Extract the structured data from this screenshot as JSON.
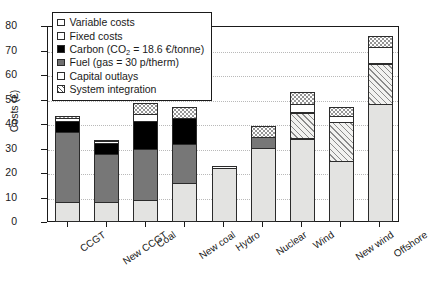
{
  "chart_data": {
    "type": "bar",
    "stacked": true,
    "title": "",
    "xlabel": "",
    "ylabel": "Costs (£)",
    "ylim": [
      0,
      80
    ],
    "yticks": [
      0,
      10,
      20,
      30,
      40,
      50,
      60,
      70,
      80
    ],
    "grid": true,
    "legend_position": "top-left",
    "categories": [
      "CCGT",
      "New CCGT",
      "Coal",
      "New coal",
      "Hydro",
      "Nuclear",
      "Wind",
      "New wind",
      "Offshore"
    ],
    "series": [
      {
        "name": "Capital outlays",
        "key": "capital",
        "color": "#e3e3e1",
        "values": [
          8,
          8,
          9,
          16,
          22,
          30,
          34,
          25,
          48
        ]
      },
      {
        "name": "Fuel (gas = 30 p/therm)",
        "key": "fuel",
        "color": "#777777",
        "values": [
          29,
          20,
          21,
          16,
          0,
          5,
          0,
          0,
          0
        ]
      },
      {
        "name": "Carbon (CO2 = 18.6 €/tonne)",
        "key": "carbon",
        "color": "#000000",
        "values": [
          5,
          5,
          12,
          11,
          0,
          0,
          0,
          0,
          0
        ]
      },
      {
        "name": "System integration",
        "key": "sysint",
        "color": "#f2f2f0",
        "values": [
          0,
          0,
          0,
          0,
          0,
          0,
          11,
          16,
          17
        ]
      },
      {
        "name": "Fixed costs",
        "key": "fixed",
        "color": "#ffffff",
        "values": [
          1.5,
          1.0,
          3,
          0,
          1.2,
          0,
          4,
          3,
          7
        ]
      },
      {
        "name": "Variable costs",
        "key": "variable",
        "color": "#ffffff",
        "values": [
          1.0,
          0.7,
          5,
          5,
          0,
          5,
          5,
          4,
          5
        ]
      }
    ],
    "totals": [
      44.5,
      34.7,
      50,
      48,
      23.2,
      40,
      54,
      48,
      77
    ]
  },
  "legend": {
    "items": [
      {
        "label": "Variable costs",
        "swatch": "variable"
      },
      {
        "label": "Fixed costs",
        "swatch": "fixed"
      },
      {
        "label_pre": "Carbon (CO",
        "label_sub": "2",
        "label_post": " = 18.6 €/tonne)",
        "swatch": "carbon"
      },
      {
        "label": "Fuel (gas = 30 p/therm)",
        "swatch": "fuel"
      },
      {
        "label": "Capital outlays",
        "swatch": "capital"
      },
      {
        "label": "System integration",
        "swatch": "sysint"
      }
    ]
  }
}
